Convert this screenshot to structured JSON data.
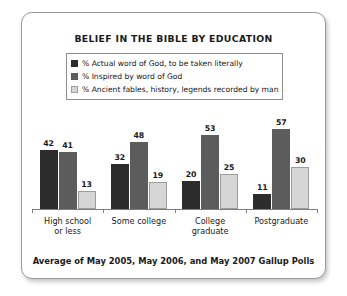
{
  "chart": {
    "title": "BELIEF IN THE BIBLE BY EDUCATION",
    "footnote": "Average of May 2005, May 2006, and May 2007 Gallup Polls"
  },
  "chart_data": {
    "type": "bar",
    "title": "BELIEF IN THE BIBLE BY EDUCATION",
    "subtitle": "Average of May 2005, May 2006, and May 2007 Gallup Polls",
    "xlabel": "",
    "ylabel": "",
    "ylim": [
      0,
      60
    ],
    "grid": false,
    "legend_position": "top",
    "categories": [
      "High school or less",
      "Some college",
      "College graduate",
      "Postgraduate"
    ],
    "category_lines": [
      [
        "High school",
        "or less"
      ],
      [
        "Some college"
      ],
      [
        "College",
        "graduate"
      ],
      [
        "Postgraduate"
      ]
    ],
    "series": [
      {
        "name": "% Actual word of God, to be taken literally",
        "color": "#2c2c2c",
        "values": [
          42,
          32,
          20,
          11
        ]
      },
      {
        "name": "% Inspired by word of God",
        "color": "#5c5c5c",
        "values": [
          41,
          48,
          53,
          57
        ]
      },
      {
        "name": "% Ancient fables, history, legends recorded by man",
        "color": "#d6d6d6",
        "values": [
          13,
          19,
          25,
          30
        ]
      }
    ]
  }
}
